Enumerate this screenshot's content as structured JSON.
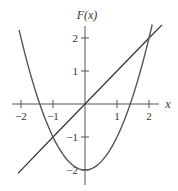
{
  "chart_data": {
    "type": "line",
    "title": "",
    "xlabel": "x",
    "ylabel": "F(x)",
    "xlim": [
      -2.3,
      2.3
    ],
    "ylim": [
      -2.4,
      2.4
    ],
    "grid": false,
    "legend": null,
    "x_ticks": [
      -2,
      -1,
      1,
      2
    ],
    "x_tick_labels": [
      "−2",
      "−1",
      "1",
      "2"
    ],
    "y_ticks": [
      -2,
      -1,
      1,
      2
    ],
    "y_tick_labels": [
      "−2",
      "−1",
      "1",
      "2"
    ],
    "series": [
      {
        "name": "parabola F(x) = x^2 - 2",
        "color": "#555555",
        "x": [
          -2.06,
          -2,
          -1.5,
          -1,
          -0.5,
          0,
          0.5,
          1,
          1.5,
          2,
          2.1
        ],
        "y": [
          2.24,
          2,
          0.25,
          -1,
          -1.75,
          -2,
          -1.75,
          -1,
          0.25,
          2,
          2.41
        ]
      },
      {
        "name": "line y = x",
        "color": "#333333",
        "x": [
          -2.1,
          -1,
          0,
          1,
          2,
          2.4
        ],
        "y": [
          -2.1,
          -1,
          0,
          1,
          2,
          2.4
        ]
      }
    ],
    "annotations": [
      {
        "type": "intersection",
        "x": -1,
        "y": -1
      },
      {
        "type": "intersection",
        "x": 2,
        "y": 2
      }
    ]
  },
  "axes": {
    "x_label": "x",
    "y_label": "F(x)",
    "x_ticks": [
      "−2",
      "−1",
      "1",
      "2"
    ],
    "y_ticks": [
      "2",
      "1",
      "−1",
      "−2"
    ]
  }
}
